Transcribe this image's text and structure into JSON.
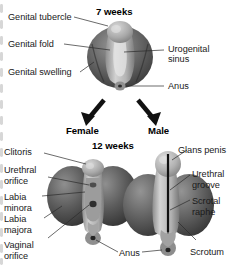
{
  "figure": {
    "title_stage_1": "7 weeks",
    "title_stage_2": "12 weeks",
    "branch_female": "Female",
    "branch_male": "Male",
    "shared_label": "Anus",
    "colors": {
      "ink": "#1a1a1a",
      "leader": "#2b2b2b",
      "tissue_dark": "#4a4a4a",
      "tissue_mid": "#8d8d8d",
      "tissue_light": "#c9c9c9",
      "background": "#ffffff"
    },
    "stage_indifferent": {
      "stage_label": "7 weeks",
      "labels": [
        {
          "text": "Genital tubercle",
          "side": "left"
        },
        {
          "text": "Genital fold",
          "side": "left"
        },
        {
          "text": "Genital swelling",
          "side": "left"
        },
        {
          "text": "Urogenital",
          "side": "right"
        },
        {
          "text": "sinus",
          "side": "right"
        },
        {
          "text": "Anus",
          "side": "right"
        }
      ]
    },
    "stage_female": {
      "heading": "Female",
      "labels": [
        {
          "text": "Clitoris"
        },
        {
          "text": "Urethral"
        },
        {
          "text": "orifice"
        },
        {
          "text": "Labia"
        },
        {
          "text": "minora"
        },
        {
          "text": "Labia"
        },
        {
          "text": "majora"
        },
        {
          "text": "Vaginal"
        },
        {
          "text": "orifice"
        }
      ]
    },
    "stage_male": {
      "heading": "Male",
      "labels": [
        {
          "text": "Glans penis"
        },
        {
          "text": "Urethral"
        },
        {
          "text": "groove"
        },
        {
          "text": "Scrotal"
        },
        {
          "text": "raphe"
        },
        {
          "text": "Scrotum"
        }
      ]
    }
  }
}
